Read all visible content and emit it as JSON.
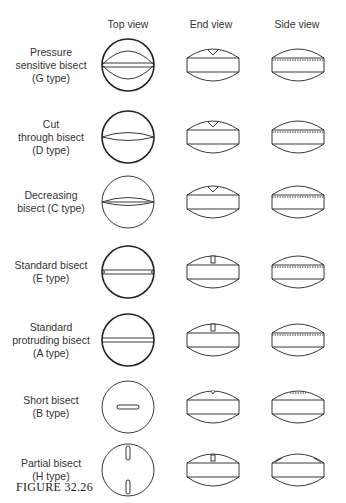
{
  "headers": {
    "top": "Top view",
    "end": "End view",
    "side": "Side view"
  },
  "rows": [
    {
      "label1": "Pressure",
      "label2": "sensitive bisect",
      "label3": "(G type)",
      "type": "G"
    },
    {
      "label1": "Cut",
      "label2": "through bisect",
      "label3": "(D type)",
      "type": "D"
    },
    {
      "label1": "Decreasing",
      "label2": "bisect (C type)",
      "label3": "",
      "type": "C"
    },
    {
      "label1": "Standard bisect",
      "label2": "(E type)",
      "label3": "",
      "type": "E"
    },
    {
      "label1": "Standard",
      "label2": "protruding bisect",
      "label3": "(A type)",
      "type": "A"
    },
    {
      "label1": "Short bisect",
      "label2": "(B type)",
      "label3": "",
      "type": "B"
    },
    {
      "label1": "Partial bisect",
      "label2": "(H type)",
      "label3": "",
      "type": "H"
    }
  ],
  "caption": "FIGURE 32.26"
}
